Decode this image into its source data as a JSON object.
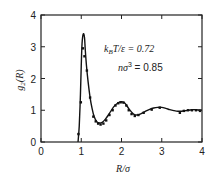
{
  "chart_data": {
    "type": "line",
    "title": "",
    "xlabel": "R/σ",
    "ylabel": "g₂(R)",
    "xlim": [
      0,
      4
    ],
    "ylim": [
      0,
      4
    ],
    "xticks": [
      0,
      1,
      2,
      3,
      4
    ],
    "yticks": [
      0,
      1,
      2,
      3,
      4
    ],
    "grid": false,
    "legend": null,
    "annotations": [
      {
        "text": "k_B T/ε = 0.72",
        "x": 2.6,
        "y": 2.9
      },
      {
        "text": "nσ³ = 0.85",
        "x": 2.6,
        "y": 2.3
      }
    ],
    "series": [
      {
        "name": "theory (solid curve)",
        "style": "line",
        "x": [
          0.92,
          0.95,
          0.98,
          1.0,
          1.02,
          1.05,
          1.08,
          1.1,
          1.13,
          1.17,
          1.22,
          1.27,
          1.32,
          1.38,
          1.45,
          1.52,
          1.6,
          1.7,
          1.8,
          1.9,
          2.0,
          2.05,
          2.1,
          2.2,
          2.3,
          2.4,
          2.5,
          2.6,
          2.7,
          2.8,
          2.9,
          3.0,
          3.1,
          3.2,
          3.3,
          3.4,
          3.5,
          3.6,
          3.7,
          3.8,
          3.9,
          4.0
        ],
        "y": [
          0.0,
          0.5,
          1.5,
          2.4,
          3.1,
          3.4,
          3.3,
          2.9,
          2.4,
          1.9,
          1.4,
          1.05,
          0.8,
          0.65,
          0.6,
          0.62,
          0.72,
          0.9,
          1.1,
          1.22,
          1.27,
          1.25,
          1.2,
          1.02,
          0.88,
          0.85,
          0.9,
          0.97,
          1.03,
          1.07,
          1.09,
          1.09,
          1.06,
          1.02,
          0.99,
          0.97,
          0.97,
          0.99,
          1.01,
          1.02,
          1.01,
          1.0
        ]
      },
      {
        "name": "simulation (dots)",
        "style": "scatter",
        "x": [
          0.93,
          0.99,
          1.04,
          1.08,
          1.14,
          1.22,
          1.3,
          1.36,
          1.42,
          1.48,
          1.55,
          1.62,
          1.7,
          1.78,
          1.85,
          1.92,
          1.98,
          2.05,
          2.12,
          2.18,
          2.25,
          2.33,
          2.42,
          2.55,
          2.75,
          2.95,
          3.45,
          3.55,
          3.65,
          3.75,
          3.85,
          3.95
        ],
        "y": [
          0.25,
          1.25,
          2.95,
          2.7,
          2.25,
          1.4,
          0.8,
          0.65,
          0.58,
          0.55,
          0.58,
          0.68,
          0.85,
          1.0,
          1.15,
          1.22,
          1.25,
          1.24,
          1.15,
          1.0,
          0.88,
          0.82,
          0.85,
          0.92,
          1.02,
          1.08,
          0.92,
          0.98,
          1.0,
          1.0,
          1.0,
          0.98
        ]
      }
    ]
  },
  "labels": {
    "xlabel": "R/σ",
    "ylabel_main": "g",
    "ylabel_sub": "2",
    "ylabel_arg": "(R)",
    "annot1_k": "k",
    "annot1_sub": "B",
    "annot1_rest": "T/ε = 0.72",
    "annot2_n": "nσ",
    "annot2_sup": "3",
    "annot2_rest": " = 0.85",
    "xticks": [
      "0",
      "1",
      "2",
      "3",
      "4"
    ],
    "yticks": [
      "0",
      "1",
      "2",
      "3",
      "4"
    ]
  }
}
